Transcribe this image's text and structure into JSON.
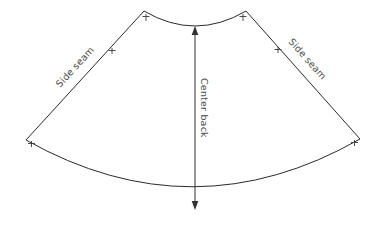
{
  "diagram": {
    "background_color": "#ffffff",
    "line_color": "#2b2b2b",
    "text_color": "#4a4a4a",
    "labels": {
      "side_seam_left": "Side seam",
      "side_seam_right": "Side seam",
      "center_back": "Center back"
    },
    "geometry": {
      "top_left_vertex": "144,11",
      "top_right_vertex": "246,11",
      "bottom_left_vertex": "26,140",
      "bottom_right_vertex": "360,139",
      "top_arc_lowest_point_y": 33,
      "bottom_arc_lowest_point_y": 211,
      "center_axis_x": 195
    },
    "grain_arrow": {
      "orientation": "vertical",
      "double_headed": true,
      "top_y": 28,
      "bottom_y": 208
    },
    "notches": [
      {
        "name": "top-left-corner-notch",
        "x": 146,
        "y": 16
      },
      {
        "name": "top-right-corner-notch",
        "x": 243,
        "y": 16
      },
      {
        "name": "left-seam-notch",
        "x": 112,
        "y": 50
      },
      {
        "name": "right-seam-notch",
        "x": 278,
        "y": 49
      },
      {
        "name": "bottom-left-corner-notch",
        "x": 31,
        "y": 143
      },
      {
        "name": "bottom-right-corner-notch",
        "x": 354,
        "y": 142
      }
    ]
  }
}
